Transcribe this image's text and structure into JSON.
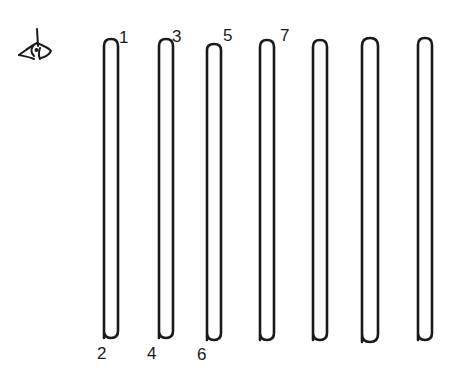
{
  "diagram": {
    "type": "tube-array",
    "ink_color": "#1a1a1a",
    "background": "#ffffff",
    "viewer_icon": "eye-viewing-icon",
    "tubes": [
      {
        "id": 1,
        "cx": 111,
        "top": 40,
        "bottom": 338,
        "top_label": "1",
        "bottom_label": "2"
      },
      {
        "id": 2,
        "cx": 166,
        "top": 40,
        "bottom": 338,
        "top_label": "3",
        "bottom_label": "4"
      },
      {
        "id": 3,
        "cx": 214,
        "top": 44,
        "bottom": 340,
        "top_label": "5",
        "bottom_label": "6"
      },
      {
        "id": 4,
        "cx": 267,
        "top": 40,
        "bottom": 340,
        "top_label": "7",
        "bottom_label": ""
      },
      {
        "id": 5,
        "cx": 320,
        "top": 40,
        "bottom": 340,
        "top_label": "",
        "bottom_label": ""
      },
      {
        "id": 6,
        "cx": 370,
        "top": 38,
        "bottom": 342,
        "top_label": "",
        "bottom_label": ""
      },
      {
        "id": 7,
        "cx": 425,
        "top": 38,
        "bottom": 340,
        "top_label": "",
        "bottom_label": ""
      }
    ],
    "labels": {
      "l1": "1",
      "l2": "2",
      "l3": "3",
      "l4": "4",
      "l5": "5",
      "l6": "6",
      "l7": "7"
    }
  }
}
